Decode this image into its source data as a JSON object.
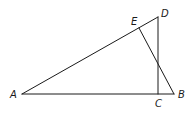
{
  "diagram": {
    "type": "geometry",
    "points": {
      "A": {
        "label": "A"
      },
      "B": {
        "label": "B"
      },
      "C": {
        "label": "C"
      },
      "D": {
        "label": "D"
      },
      "E": {
        "label": "E"
      }
    },
    "segments": [
      {
        "from": "A",
        "to": "D"
      },
      {
        "from": "A",
        "to": "B"
      },
      {
        "from": "D",
        "to": "C"
      },
      {
        "from": "E",
        "to": "B"
      }
    ],
    "relations": [
      "E lies on segment AD",
      "C lies on segment AB",
      "DC is perpendicular to AB"
    ]
  }
}
